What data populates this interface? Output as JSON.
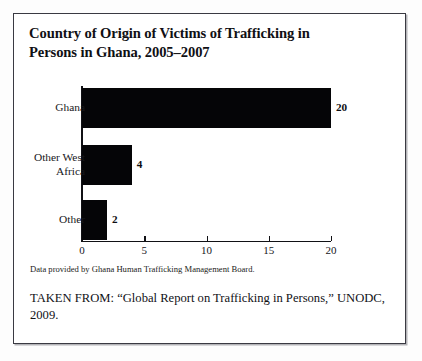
{
  "figure": {
    "title": "Country of Origin of Victims of Trafficking in Persons in Ghana, 2005–2007",
    "data_note": "Data provided by Ghana Human Trafficking Management Board.",
    "source_note": "TAKEN FROM: “Global Report on Trafficking in Persons,” UNODC, 2009.",
    "border_color": "#3a3a42",
    "bar_color": "#050507"
  },
  "chart_data": {
    "type": "bar",
    "orientation": "horizontal",
    "title": "Country of Origin of Victims of Trafficking in Persons in Ghana, 2005–2007",
    "xlabel": "",
    "ylabel": "",
    "categories": [
      "Ghana",
      "Other West Africa",
      "Other"
    ],
    "values": [
      20,
      4,
      2
    ],
    "value_labels": [
      "20",
      "4",
      "2"
    ],
    "xlim": [
      0,
      20
    ],
    "xticks": [
      0,
      5,
      10,
      15,
      20
    ],
    "xtick_labels": [
      "0",
      "5",
      "10",
      "15",
      "20"
    ],
    "grid": false,
    "legend": false,
    "series": [
      {
        "name": "Victims of trafficking",
        "values": [
          20,
          4,
          2
        ]
      }
    ]
  }
}
